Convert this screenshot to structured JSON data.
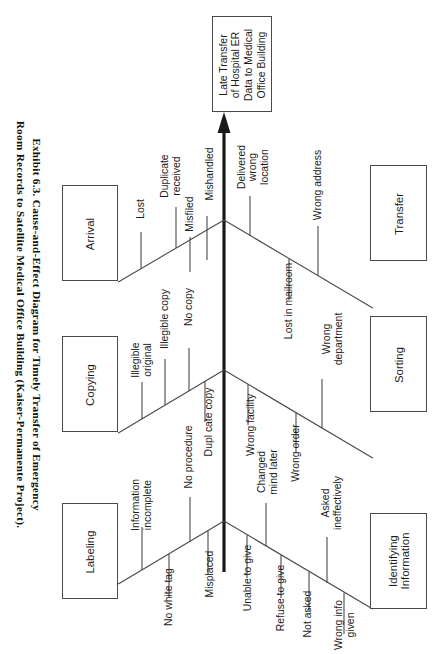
{
  "caption": {
    "line1": "Exhibit 6.3.  Cause-and-Effect Diagram for Timely Transfer of Emergency",
    "line2": "Room Records to Satellite Medical Office  Building  (Kaiser-Permanente Project)."
  },
  "diagram": {
    "type": "fishbone",
    "orientation": "rotated-90-spine-vertical-arrow-up",
    "effect": {
      "label": "Late Transfer of Hospital ER Data to Medical Office Building",
      "lines": [
        "Late Transfer",
        "of Hospital ER",
        "Data to Medical",
        "Office Building"
      ]
    },
    "categories": [
      {
        "name": "Arrival",
        "side": "left",
        "causes": [
          "Lost",
          "Duplicate received",
          "Misfiled",
          "Mishandled"
        ]
      },
      {
        "name": "Transfer",
        "side": "right",
        "causes": [
          "Delivered wrong location",
          "Lost in mailroom",
          "Wrong address"
        ]
      },
      {
        "name": "Copying",
        "side": "left",
        "causes": [
          "Illegible original",
          "Illegible copy",
          "No copy",
          "Duplicate copy"
        ]
      },
      {
        "name": "Sorting",
        "side": "right",
        "causes": [
          "Wrong facility",
          "Wrong order",
          "Wrong department"
        ]
      },
      {
        "name": "Labeling",
        "side": "left",
        "causes": [
          "Information incomplete",
          "No white tag",
          "No procedure",
          "Misplaced"
        ]
      },
      {
        "name": "Identifying Information",
        "side": "right",
        "lines": [
          "Identifying",
          "Information"
        ],
        "causes": [
          "Unable to give",
          "Changed mind later",
          "Refuse to give",
          "Not asked",
          "Asked ineffectively",
          "Wrong info given"
        ]
      }
    ],
    "causeText": {
      "lost": "Lost",
      "duplicateReceived1": "Duplicate",
      "duplicateReceived2": "received",
      "misfiled": "Misfiled",
      "mishandled": "Mishandled",
      "deliveredWrong1": "Delivered",
      "deliveredWrong2": "wrong",
      "deliveredWrong3": "location",
      "lostMailroom": "Lost in mailroom",
      "wrongAddress": "Wrong address",
      "illegibleOrig1": "Illegible",
      "illegibleOrig2": "original",
      "illegibleCopy": "Illegible  copy",
      "noCopy": "No copy",
      "duplicateCopy": "Dupl cate copy",
      "wrongFacility": "Wrong facility",
      "wrongOrder": "Wrong order",
      "wrongDept1": "Wrong",
      "wrongDept2": "department",
      "infoIncomplete1": "Information",
      "infoIncomplete2": "incomplete",
      "noWhiteTag": "No white tag",
      "noProcedure": "No procedure",
      "misplaced": "Misplaced",
      "unableToGive": "Unable to give",
      "changedMind1": "Changed",
      "changedMind2": "mind later",
      "refuseToGive": "Refuse to give",
      "notAsked": "Not asked",
      "askedIneff1": "Asked",
      "askedIneff2": "ineffectively",
      "wrongInfo1": "Wrong info",
      "wrongInfo2": "given"
    },
    "colors": {
      "line": "#4a4a4a",
      "spine": "#1a1a1a",
      "text": "#1c1c1c",
      "background": "#ffffff"
    }
  }
}
